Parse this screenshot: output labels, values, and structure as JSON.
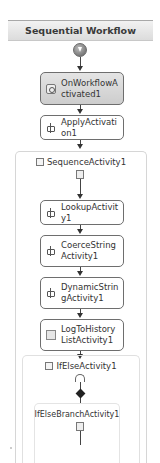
{
  "workflow": {
    "title": "Sequential Workflow",
    "activities": [
      {
        "name": "OnWorkflowActivated1",
        "icon": "event-icon",
        "style": "gray"
      },
      {
        "name": "ApplyActivation1",
        "icon": "workflow-activity-icon",
        "style": "normal"
      }
    ],
    "sequence": {
      "label": "SequenceActivity1",
      "activities": [
        {
          "name": "LookupActivity1",
          "icon": "workflow-activity-icon"
        },
        {
          "name": "CoerceStringActivity1",
          "icon": "workflow-activity-icon"
        },
        {
          "name": "DynamicStringActivity1",
          "icon": "workflow-activity-icon"
        },
        {
          "name": "LogToHistoryListActivity1",
          "icon": "log-icon"
        }
      ],
      "ifelse": {
        "label": "IfElseActivity1",
        "branch": {
          "label": "IfElseBranchActivity1"
        }
      }
    }
  },
  "colors": {
    "header_bg": "#dcdcdc",
    "connector": "#444444",
    "activity_border": "#6e6e6e",
    "container_border": "#d6d6d6"
  }
}
